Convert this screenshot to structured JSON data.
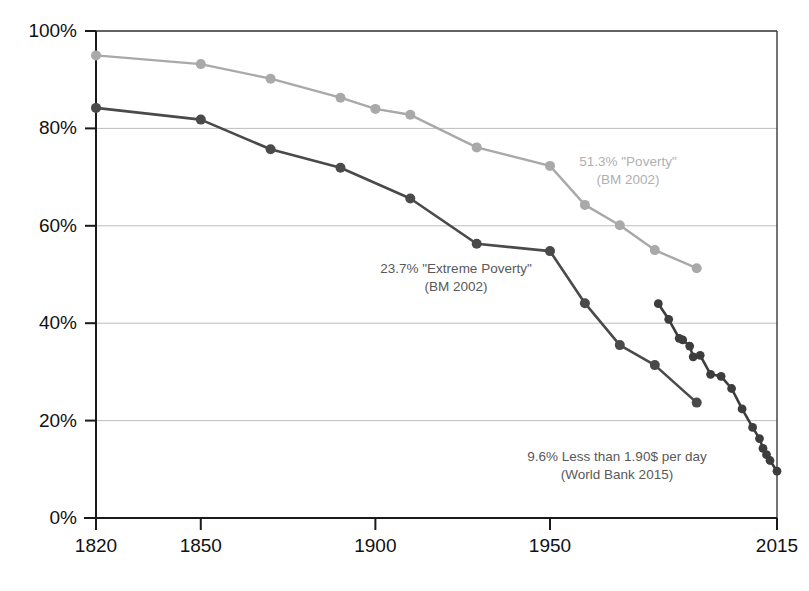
{
  "chart_data": {
    "type": "line",
    "title": "",
    "subtitle": "",
    "xlabel": "",
    "ylabel": "",
    "xlim": [
      1820,
      2015
    ],
    "ylim": [
      0,
      100
    ],
    "grid": true,
    "legend_position": "inline-annotations",
    "y_ticks": [
      "0%",
      "20%",
      "40%",
      "60%",
      "80%",
      "100%"
    ],
    "y_tick_values": [
      0,
      20,
      40,
      60,
      80,
      100
    ],
    "x_ticks": [
      "1820",
      "1850",
      "1900",
      "1950",
      "2015"
    ],
    "x_tick_values": [
      1820,
      1850,
      1900,
      1950,
      2015
    ],
    "series": [
      {
        "name": "\"Poverty\" (BM 2002)",
        "color": "#a9a9a9",
        "end_value": 51.3,
        "x": [
          1820,
          1850,
          1870,
          1890,
          1900,
          1910,
          1929,
          1950,
          1960,
          1970,
          1980,
          1992
        ],
        "values": [
          95,
          93.2,
          90.2,
          86.3,
          84,
          82.8,
          76.1,
          72.3,
          64.3,
          60.1,
          55,
          51.3
        ]
      },
      {
        "name": "\"Extreme Poverty\" (BM 2002)",
        "color": "#4a4a4a",
        "end_value": 23.7,
        "x": [
          1820,
          1850,
          1870,
          1890,
          1910,
          1929,
          1950,
          1960,
          1970,
          1980,
          1992
        ],
        "values": [
          84.2,
          81.8,
          75.7,
          71.9,
          65.6,
          56.3,
          54.8,
          44.1,
          35.5,
          31.4,
          23.7
        ]
      },
      {
        "name": "Less than 1.90$ per day (World Bank 2015)",
        "color": "#3d3d3d",
        "end_value": 9.6,
        "x": [
          1981,
          1984,
          1987,
          1988,
          1990,
          1991,
          1993,
          1996,
          1999,
          2002,
          2005,
          2008,
          2010,
          2011,
          2012,
          2013,
          2015
        ],
        "values": [
          44.0,
          40.8,
          36.9,
          36.6,
          35.3,
          33.1,
          33.4,
          29.5,
          29.1,
          26.6,
          22.4,
          18.6,
          16.3,
          14.3,
          13.0,
          11.8,
          9.6
        ]
      }
    ],
    "annotations": [
      {
        "id": "poverty-annotation",
        "line1": "51.3% \"Poverty\"",
        "line2": "(BM 2002)",
        "color": "#b0b0b0",
        "x": 628,
        "y": 166
      },
      {
        "id": "extreme-poverty-annotation",
        "line1": "23.7% \"Extreme Poverty\"",
        "line2": "(BM 2002)",
        "color": "#595959",
        "x": 456,
        "y": 273
      },
      {
        "id": "world-bank-annotation",
        "line1": "9.6% Less than 1.90$ per day",
        "line2": "(World Bank 2015)",
        "color": "#595959",
        "x": 617,
        "y": 461
      }
    ]
  }
}
